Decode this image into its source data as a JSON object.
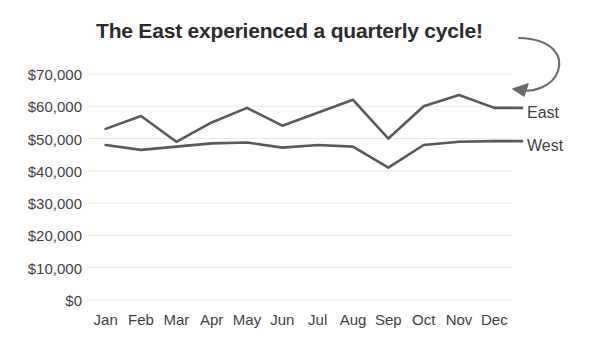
{
  "chart_data": {
    "type": "line",
    "title": "The East experienced a quarterly cycle!",
    "xlabel": "",
    "ylabel": "",
    "categories": [
      "Jan",
      "Feb",
      "Mar",
      "Apr",
      "May",
      "Jun",
      "Jul",
      "Aug",
      "Sep",
      "Oct",
      "Nov",
      "Dec"
    ],
    "series": [
      {
        "name": "East",
        "color": "#595959",
        "values": [
          53000,
          57000,
          49000,
          55000,
          59500,
          54000,
          58000,
          62000,
          50000,
          60000,
          63500,
          59500
        ]
      },
      {
        "name": "West",
        "color": "#595959",
        "values": [
          48000,
          46500,
          47500,
          48500,
          48800,
          47200,
          48000,
          47500,
          41000,
          48000,
          49000,
          49200
        ]
      }
    ],
    "ylim": [
      0,
      70000
    ],
    "yticks": [
      0,
      10000,
      20000,
      30000,
      40000,
      50000,
      60000,
      70000
    ],
    "ytick_labels": [
      "$0",
      "$10,000",
      "$20,000",
      "$30,000",
      "$40,000",
      "$50,000",
      "$60,000",
      "$70,000"
    ],
    "grid": true,
    "grid_color": "#e8e8e8",
    "legend_position": "right-inline",
    "annotations": [
      {
        "name": "curved-arrow",
        "text": "",
        "points_to": "East Nov peak",
        "color": "#6b6b6b"
      }
    ],
    "background": "#ffffff",
    "title_color": "#2b2b2b",
    "tick_color": "#3f3f3f"
  },
  "legend": {
    "east_label": "East",
    "west_label": "West"
  }
}
